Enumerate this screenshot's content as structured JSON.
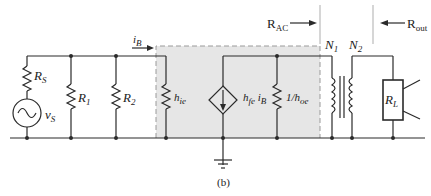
{
  "figure": {
    "caption": "(b)",
    "colors": {
      "line": "#2a2a2a",
      "shade": "#e6e6e6",
      "dash": "#9a9a9a"
    }
  },
  "labels": {
    "rs": {
      "main": "R",
      "sub": "S"
    },
    "vs": {
      "main": "v",
      "sub": "S"
    },
    "r1": {
      "main": "R",
      "sub": "1"
    },
    "r2": {
      "main": "R",
      "sub": "2"
    },
    "ib": {
      "main": "i",
      "sub": "B"
    },
    "hie": {
      "main": "h",
      "sub": "ie"
    },
    "hfe": {
      "main": "h",
      "sub": "fe",
      "tail": " i",
      "tail_sub": "B"
    },
    "hoe": {
      "main": "1/h",
      "sub": "oe"
    },
    "n1": {
      "main": "N",
      "sub": "1"
    },
    "n2": {
      "main": "N",
      "sub": "2"
    },
    "rl": {
      "main": "R",
      "sub": "L"
    },
    "rac": {
      "main": "R",
      "sub": "AC"
    },
    "rout": {
      "main": "R",
      "sub": "out"
    }
  }
}
